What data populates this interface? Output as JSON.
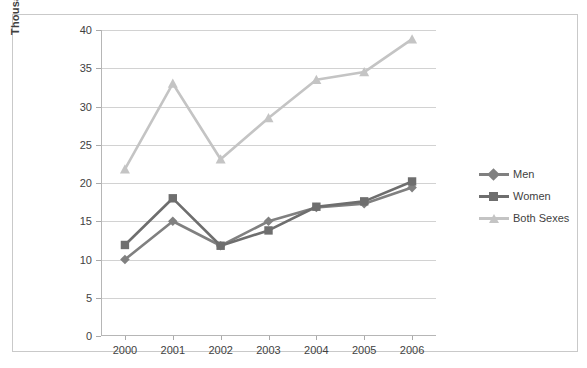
{
  "chart_data": {
    "type": "line",
    "title": "",
    "xlabel": "",
    "ylabel": "Thousands",
    "categories": [
      "2000",
      "2001",
      "2002",
      "2003",
      "2004",
      "2005",
      "2006"
    ],
    "ylim": [
      0,
      40
    ],
    "ytick_step": 5,
    "yticks": [
      "0",
      "5",
      "10",
      "15",
      "20",
      "25",
      "30",
      "35",
      "40"
    ],
    "grid": "horizontal",
    "legend_position": "right",
    "series": [
      {
        "name": "Men",
        "color": "#808080",
        "marker": "diamond",
        "values": [
          10.0,
          15.0,
          11.8,
          15.0,
          16.8,
          17.3,
          19.4
        ]
      },
      {
        "name": "Women",
        "color": "#6e6e6e",
        "marker": "square",
        "values": [
          11.9,
          18.0,
          11.8,
          13.8,
          16.9,
          17.6,
          20.2
        ]
      },
      {
        "name": "Both Sexes",
        "color": "#c4c4c4",
        "marker": "triangle",
        "values": [
          21.8,
          33.0,
          23.1,
          28.5,
          33.5,
          34.5,
          38.8
        ]
      }
    ]
  },
  "legend": {
    "items": [
      {
        "label": "Men"
      },
      {
        "label": "Women"
      },
      {
        "label": "Both Sexes"
      }
    ]
  }
}
